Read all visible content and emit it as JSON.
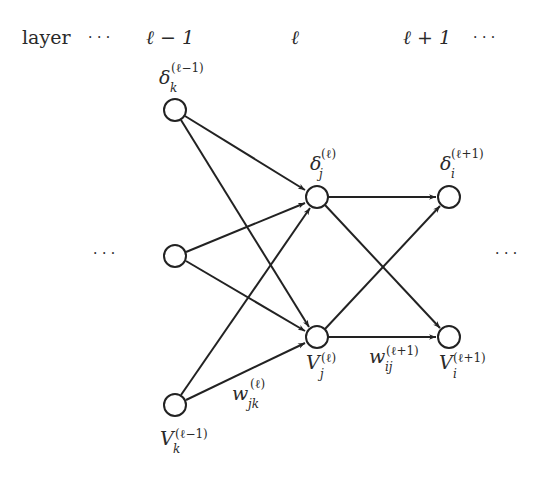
{
  "header": {
    "layer_label": "layer",
    "left_dots": "· · ·",
    "col_prev": "ℓ − 1",
    "col_curr": "ℓ",
    "col_next": "ℓ + 1",
    "right_dots": "· · ·"
  },
  "side": {
    "left_dots": "· · ·",
    "right_dots": "· · ·"
  },
  "labels": {
    "delta_k": {
      "base": "δ",
      "sub": "k",
      "sup": "(ℓ−1)"
    },
    "V_k": {
      "base": "V",
      "sub": "k",
      "sup": "(ℓ−1)"
    },
    "delta_j": {
      "base": "δ",
      "sub": "j",
      "sup": "(ℓ)"
    },
    "V_j": {
      "base": "V",
      "sub": "j",
      "sup": "(ℓ)"
    },
    "delta_i": {
      "base": "δ",
      "sub": "i",
      "sup": "(ℓ+1)"
    },
    "V_i": {
      "base": "V",
      "sub": "i",
      "sup": "(ℓ+1)"
    },
    "w_jk": {
      "base": "w",
      "sub": "jk",
      "sup": "(ℓ)"
    },
    "w_ij": {
      "base": "w",
      "sub": "ij",
      "sup": "(ℓ+1)"
    }
  },
  "nodes": [
    {
      "id": "k_top",
      "layer": "ℓ−1",
      "cx": 175,
      "cy": 110
    },
    {
      "id": "k_mid",
      "layer": "ℓ−1",
      "cx": 175,
      "cy": 256
    },
    {
      "id": "k_bot",
      "layer": "ℓ−1",
      "cx": 175,
      "cy": 405
    },
    {
      "id": "j_top",
      "layer": "ℓ",
      "cx": 317,
      "cy": 197
    },
    {
      "id": "j_bot",
      "layer": "ℓ",
      "cx": 317,
      "cy": 337
    },
    {
      "id": "i_top",
      "layer": "ℓ+1",
      "cx": 449,
      "cy": 197
    },
    {
      "id": "i_bot",
      "layer": "ℓ+1",
      "cx": 449,
      "cy": 337
    }
  ],
  "edges": [
    {
      "from": "k_top",
      "to": "j_top"
    },
    {
      "from": "k_top",
      "to": "j_bot"
    },
    {
      "from": "k_mid",
      "to": "j_top"
    },
    {
      "from": "k_mid",
      "to": "j_bot"
    },
    {
      "from": "k_bot",
      "to": "j_top"
    },
    {
      "from": "k_bot",
      "to": "j_bot"
    },
    {
      "from": "j_top",
      "to": "i_top"
    },
    {
      "from": "j_top",
      "to": "i_bot"
    },
    {
      "from": "j_bot",
      "to": "i_top"
    },
    {
      "from": "j_bot",
      "to": "i_bot"
    }
  ]
}
